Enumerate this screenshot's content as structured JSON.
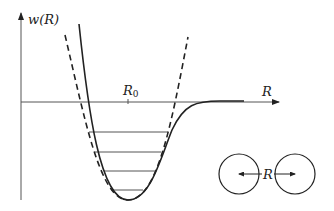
{
  "diagram": {
    "y_axis_label": "w(R)",
    "x_axis_label": "R",
    "equilibrium_label_main": "R",
    "equilibrium_label_sub": "0",
    "separation_label": "R",
    "curves": [
      {
        "name": "actual-potential",
        "style": "solid"
      },
      {
        "name": "harmonic-approximation",
        "style": "dashed"
      }
    ],
    "energy_levels_count": 4,
    "stroke_color": "#222222"
  }
}
